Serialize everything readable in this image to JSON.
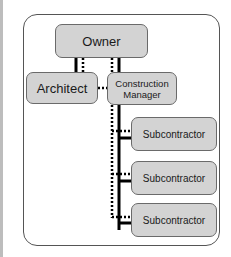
{
  "diagram": {
    "type": "organizational-relationship",
    "nodes": {
      "owner": "Owner",
      "architect": "Architect",
      "construction_manager": {
        "line1": "Construction",
        "line2": "Manager"
      },
      "subcontractors": [
        "Subcontractor",
        "Subcontractor",
        "Subcontractor"
      ]
    },
    "edges": [
      {
        "from": "Owner",
        "to": "Architect",
        "styles": [
          "solid",
          "dotted"
        ]
      },
      {
        "from": "Owner",
        "to": "Construction Manager",
        "styles": [
          "solid",
          "dotted"
        ]
      },
      {
        "from": "Architect",
        "to": "Construction Manager",
        "styles": [
          "dotted"
        ]
      },
      {
        "from": "Construction Manager",
        "to": "Subcontractor 1",
        "styles": [
          "solid",
          "dotted"
        ]
      },
      {
        "from": "Construction Manager",
        "to": "Subcontractor 2",
        "styles": [
          "solid",
          "dotted"
        ]
      },
      {
        "from": "Construction Manager",
        "to": "Subcontractor 3",
        "styles": [
          "solid",
          "dotted"
        ]
      }
    ],
    "legend_meaning": {
      "solid": "contractual",
      "dotted": "communication"
    },
    "colors": {
      "box_fill": "#d3d3d3",
      "box_border": "#6a6a6a",
      "line": "#000000",
      "frame_border": "#555555"
    }
  }
}
